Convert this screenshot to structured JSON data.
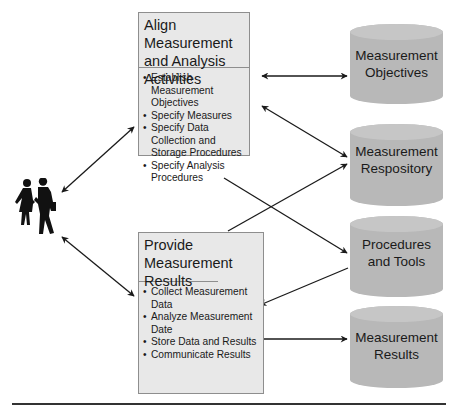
{
  "activities": [
    {
      "title": "Align Measurement and Analysis Activities",
      "items": [
        "Establish Measurement Objectives",
        "Specify Measures",
        "Specify Data Collection and Storage Procedures",
        "Specify Analysis Procedures"
      ]
    },
    {
      "title": "Provide Measurement Results",
      "items": [
        "Collect Measurement Data",
        "Analyze Measurement Date",
        "Store Data and Results",
        "Communicate Results"
      ]
    }
  ],
  "repositories": [
    {
      "line1": "Measurement",
      "line2": "Objectives"
    },
    {
      "line1": "Measurement",
      "line2": "Respository"
    },
    {
      "line1": "Procedures",
      "line2": "and Tools"
    },
    {
      "line1": "Measurement",
      "line2": "Results"
    }
  ],
  "actors": {
    "icon": "people-icon"
  },
  "colors": {
    "box_fill": "#e8e8e8",
    "cylinder_fill": "#b8b8b8",
    "cylinder_top": "#c6c6c6",
    "arrow": "#1a1a1a"
  }
}
